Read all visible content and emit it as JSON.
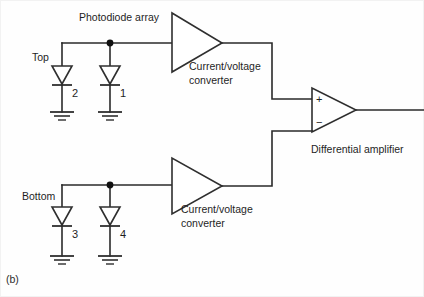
{
  "figure": {
    "panel_label": "(b)",
    "background_color": "#fefefe",
    "ink_color": "#2a2a2a"
  },
  "labels": {
    "photodiode_array": "Photodiode array",
    "top": "Top",
    "bottom": "Bottom",
    "converter_top_line1": "Current/voltage",
    "converter_top_line2": "converter",
    "converter_bottom_line1": "Current/voltage",
    "converter_bottom_line2": "converter",
    "differential_amplifier": "Differential amplifier"
  },
  "diodes": [
    {
      "id": "diode-2",
      "number": "2",
      "group": "top"
    },
    {
      "id": "diode-1",
      "number": "1",
      "group": "top"
    },
    {
      "id": "diode-3",
      "number": "3",
      "group": "bottom"
    },
    {
      "id": "diode-4",
      "number": "4",
      "group": "bottom"
    }
  ],
  "amplifier_inputs": {
    "plus": "+",
    "minus": "−"
  },
  "blocks": [
    {
      "id": "cv-converter-top",
      "name": "Current/voltage converter"
    },
    {
      "id": "cv-converter-bottom",
      "name": "Current/voltage converter"
    },
    {
      "id": "differential-amplifier",
      "name": "Differential amplifier"
    }
  ]
}
